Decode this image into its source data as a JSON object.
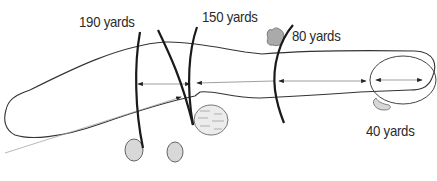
{
  "diagram": {
    "type": "golf-hole-yardage-diagram",
    "labels": [
      {
        "id": "yards-190",
        "text": "190 yards"
      },
      {
        "id": "yards-150",
        "text": "150 yards"
      },
      {
        "id": "yards-80",
        "text": "80 yards"
      },
      {
        "id": "yards-40",
        "text": "40 yards"
      }
    ],
    "elements": {
      "fairway": "fairway-outline",
      "green": "green-circle",
      "bunkers": [
        "bunker-left-1",
        "bunker-left-2",
        "bunker-greenside"
      ],
      "water": "water-hazard",
      "tree": "tree-near-80",
      "markers": [
        "marker-190",
        "marker-150-a",
        "marker-150-b",
        "marker-80"
      ],
      "arrows": [
        "shot-line",
        "distance-arrow-1",
        "distance-arrow-2",
        "distance-arrow-green"
      ]
    },
    "colors": {
      "outline": "#333333",
      "marker": "#1a1a1a",
      "hazard_fill": "#d8d8d8",
      "arrow": "#555555"
    }
  }
}
